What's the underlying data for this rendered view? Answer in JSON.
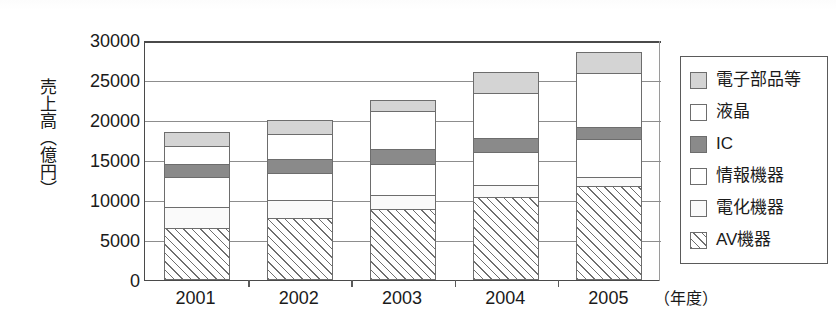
{
  "chart_data": {
    "type": "bar",
    "stacked": true,
    "title": "",
    "xlabel": "年度",
    "ylabel": "売上高（億円）",
    "categories": [
      "2001",
      "2002",
      "2003",
      "2004",
      "2005"
    ],
    "ylim": [
      0,
      30000
    ],
    "yticks": [
      30000,
      25000,
      20000,
      15000,
      10000,
      5000,
      0
    ],
    "ytick_labels": [
      "30000",
      "25000",
      "20000",
      "15000",
      "10000",
      "5000",
      "0"
    ],
    "grid": true,
    "legend_position": "right",
    "series": [
      {
        "name": "電子部品等",
        "pattern": "light-gray",
        "color": "#d4d4d4",
        "values": [
          1750,
          1800,
          1400,
          2600,
          2600
        ]
      },
      {
        "name": "液晶",
        "pattern": "white",
        "color": "#ffffff",
        "values": [
          2250,
          3150,
          4750,
          5650,
          6750
        ]
      },
      {
        "name": "IC",
        "pattern": "dark-gray",
        "color": "#8a8a8a",
        "values": [
          1600,
          1750,
          1850,
          1750,
          1500
        ]
      },
      {
        "name": "情報機器",
        "pattern": "white",
        "color": "#ffffff",
        "values": [
          3750,
          3400,
          3900,
          4150,
          4750
        ]
      },
      {
        "name": "電化機器",
        "pattern": "white",
        "color": "#fafafa",
        "values": [
          2600,
          2200,
          1750,
          1500,
          1150
        ]
      },
      {
        "name": "AV機器",
        "pattern": "diagonal-hatch",
        "color": "#ffffff",
        "values": [
          6500,
          7750,
          8875,
          10375,
          11750
        ]
      }
    ],
    "totals": [
      18450,
      20050,
      22525,
      26025,
      28500
    ]
  },
  "axis": {
    "y_title": "売上高（億円）",
    "x_unit_label": "（年度）"
  },
  "legend": {
    "items": [
      {
        "label": "電子部品等",
        "swatch": "light-gray-swatch"
      },
      {
        "label": "液晶",
        "swatch": "white-swatch"
      },
      {
        "label": "IC",
        "swatch": "dark-gray-swatch"
      },
      {
        "label": "情報機器",
        "swatch": "white-swatch"
      },
      {
        "label": "電化機器",
        "swatch": "white-swatch"
      },
      {
        "label": "AV機器",
        "swatch": "hatch-swatch"
      }
    ]
  }
}
